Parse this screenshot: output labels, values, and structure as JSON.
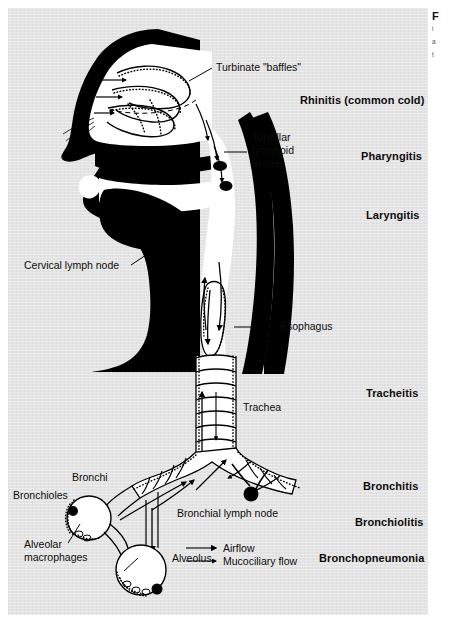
{
  "figure": {
    "panel_background": "#e3e3e3",
    "page_background": "#ffffff",
    "ink_color": "#000000"
  },
  "leader_labels": [
    {
      "id": "turbinate",
      "text": "Turbinate \"baffles\""
    },
    {
      "id": "tonsillar_l1",
      "text": "Tonsillar"
    },
    {
      "id": "tonsillar_l2",
      "text": "lymphoid"
    },
    {
      "id": "tonsillar_l3",
      "text": "tissues"
    },
    {
      "id": "cervical_node",
      "text": "Cervical lymph node"
    },
    {
      "id": "esophagus",
      "text": "Esophagus"
    },
    {
      "id": "trachea",
      "text": "Trachea"
    },
    {
      "id": "bronchi",
      "text": "Bronchi"
    },
    {
      "id": "bronchioles",
      "text": "Bronchioles"
    },
    {
      "id": "bronchial_node",
      "text": "Bronchial lymph node"
    },
    {
      "id": "alveolar_mac_l1",
      "text": "Alveolar"
    },
    {
      "id": "alveolar_mac_l2",
      "text": "macrophages"
    },
    {
      "id": "alveolus",
      "text": "Alveolus"
    }
  ],
  "condition_labels": [
    {
      "id": "rhinitis",
      "text": "Rhinitis (common cold)"
    },
    {
      "id": "pharyngitis",
      "text": "Pharyngitis"
    },
    {
      "id": "laryngitis",
      "text": "Laryngitis"
    },
    {
      "id": "tracheitis",
      "text": "Tracheitis"
    },
    {
      "id": "bronchitis",
      "text": "Bronchitis"
    },
    {
      "id": "bronchiolitis",
      "text": "Bronchiolitis"
    },
    {
      "id": "bronchopneumonia",
      "text": "Bronchopneumonia"
    }
  ],
  "legend": {
    "items": [
      {
        "id": "airflow",
        "text": "Airflow"
      },
      {
        "id": "mucociliary",
        "text": "Mucociliary flow"
      }
    ]
  },
  "caption_sliver": {
    "heading": "F",
    "lines": [
      "i",
      "a",
      "t"
    ]
  }
}
